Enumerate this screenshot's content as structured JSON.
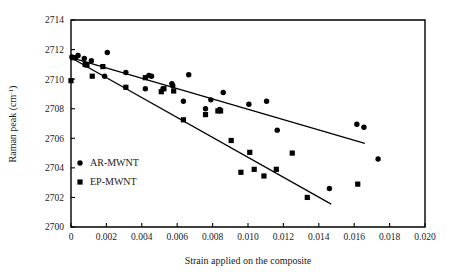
{
  "chart_data": {
    "type": "scatter",
    "title": "",
    "xlabel": "Strain applied on the composite",
    "ylabel": "Raman peak (cm",
    "ylabel_sup": "-1",
    "ylabel_tail": ")",
    "xlim": [
      0,
      0.02
    ],
    "ylim": [
      2700,
      2714
    ],
    "grid": false,
    "legend_position": "inner-left-lower",
    "xticks": [
      0,
      0.002,
      0.004,
      0.006,
      0.008,
      0.01,
      0.012,
      0.014,
      0.016,
      0.018,
      0.02
    ],
    "xtick_labels": [
      "0",
      "0.002",
      "0.004",
      "0.006",
      "0.008",
      "0.010",
      "0.012",
      "0.014",
      "0.016",
      "0.018",
      "0.020"
    ],
    "yticks": [
      2700,
      2702,
      2704,
      2706,
      2708,
      2710,
      2712,
      2714
    ],
    "ytick_labels": [
      "2700",
      "2702",
      "2704",
      "2706",
      "2708",
      "2710",
      "2712",
      "2714"
    ],
    "series": [
      {
        "name": "AR-MWNT",
        "marker": "circle",
        "color": "#000000",
        "points": [
          [
            5e-05,
            2711.5
          ],
          [
            0.00025,
            2711.45
          ],
          [
            0.0004,
            2711.6
          ],
          [
            0.00075,
            2711.4
          ],
          [
            0.00115,
            2711.25
          ],
          [
            0.0019,
            2710.2
          ],
          [
            0.00205,
            2711.8
          ],
          [
            0.0031,
            2710.45
          ],
          [
            0.0042,
            2709.35
          ],
          [
            0.0044,
            2710.25
          ],
          [
            0.00455,
            2710.2
          ],
          [
            0.0052,
            2709.35
          ],
          [
            0.0057,
            2709.7
          ],
          [
            0.00575,
            2709.55
          ],
          [
            0.00635,
            2708.5
          ],
          [
            0.00665,
            2710.3
          ],
          [
            0.0076,
            2708.0
          ],
          [
            0.0079,
            2708.6
          ],
          [
            0.0084,
            2707.95
          ],
          [
            0.0086,
            2709.1
          ],
          [
            0.01005,
            2708.3
          ],
          [
            0.01105,
            2708.5
          ],
          [
            0.01165,
            2706.55
          ],
          [
            0.0146,
            2702.6
          ],
          [
            0.01615,
            2706.95
          ],
          [
            0.01655,
            2706.75
          ],
          [
            0.01735,
            2704.6
          ]
        ],
        "fit_line": {
          "x_start": 0.0,
          "y_start": 2711.45,
          "x_end": 0.0166,
          "y_end": 2705.65
        }
      },
      {
        "name": "EP-MWNT",
        "marker": "square",
        "color": "#000000",
        "points": [
          [
            0.0,
            2709.9
          ],
          [
            0.0001,
            2711.45
          ],
          [
            0.0008,
            2711.0
          ],
          [
            0.0009,
            2710.95
          ],
          [
            0.0012,
            2710.2
          ],
          [
            0.0018,
            2710.85
          ],
          [
            0.0031,
            2709.45
          ],
          [
            0.0042,
            2710.1
          ],
          [
            0.0051,
            2709.15
          ],
          [
            0.00525,
            2709.35
          ],
          [
            0.0058,
            2709.2
          ],
          [
            0.00635,
            2707.25
          ],
          [
            0.0076,
            2707.6
          ],
          [
            0.0083,
            2707.85
          ],
          [
            0.00845,
            2707.85
          ],
          [
            0.00905,
            2705.85
          ],
          [
            0.0096,
            2703.7
          ],
          [
            0.0101,
            2705.05
          ],
          [
            0.01035,
            2703.9
          ],
          [
            0.0109,
            2703.45
          ],
          [
            0.0116,
            2703.9
          ],
          [
            0.0125,
            2705.0
          ],
          [
            0.01335,
            2702.0
          ],
          [
            0.0162,
            2702.9
          ]
        ],
        "fit_line": {
          "x_start": 0.0,
          "y_start": 2711.45,
          "x_end": 0.0147,
          "y_end": 2701.55
        }
      }
    ]
  },
  "legend": {
    "entries": [
      {
        "label": "AR-MWNT",
        "marker": "circle"
      },
      {
        "label": "EP-MWNT",
        "marker": "square"
      }
    ]
  },
  "colors": {
    "ink": "#000000",
    "background": "#ffffff",
    "caption_ghost": "#c9c9c9"
  },
  "caption": {
    "partial_text": "                                                                                                                                 "
  }
}
